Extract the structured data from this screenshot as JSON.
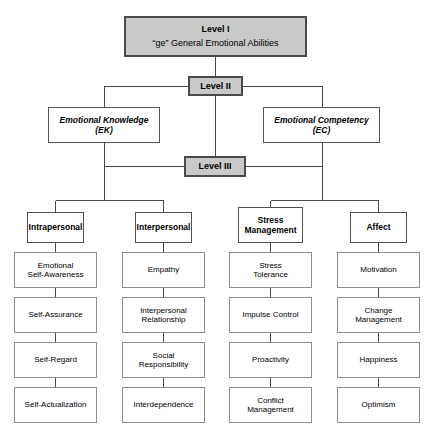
{
  "diagram": {
    "title_level_1": "Level I",
    "subtitle_level_1": "“ge” General Emotional Abilities",
    "level_2": "Level II",
    "level_3": "Level III",
    "branches": [
      {
        "name_line1": "Emotional Knowledge",
        "name_line2": "(EK)"
      },
      {
        "name_line1": "Emotional Competency",
        "name_line2": "(EC)"
      }
    ],
    "columns": [
      {
        "header_line1": "Intrapersonal",
        "header_line2": "",
        "items": [
          {
            "line1": "Emotional",
            "line2": "Self-Awareness"
          },
          {
            "line1": "Self-Assurance",
            "line2": ""
          },
          {
            "line1": "Self-Regard",
            "line2": ""
          },
          {
            "line1": "Self-Actualization",
            "line2": ""
          }
        ]
      },
      {
        "header_line1": "Interpersonal",
        "header_line2": "",
        "items": [
          {
            "line1": "Empathy",
            "line2": ""
          },
          {
            "line1": "Interpersonal",
            "line2": "Relationship"
          },
          {
            "line1": "Social",
            "line2": "Responsibility"
          },
          {
            "line1": "Interdependence",
            "line2": ""
          }
        ]
      },
      {
        "header_line1": "Stress",
        "header_line2": "Management",
        "items": [
          {
            "line1": "Stress",
            "line2": "Tolerance"
          },
          {
            "line1": "Impulse Control",
            "line2": ""
          },
          {
            "line1": "Proactivity",
            "line2": ""
          },
          {
            "line1": "Conflict",
            "line2": "Management"
          }
        ]
      },
      {
        "header_line1": "Affect",
        "header_line2": "",
        "items": [
          {
            "line1": "Motivation",
            "line2": ""
          },
          {
            "line1": "Change",
            "line2": "Management"
          },
          {
            "line1": "Happiness",
            "line2": ""
          },
          {
            "line1": "Optimism",
            "line2": ""
          }
        ]
      }
    ],
    "colors": {
      "level_fill": "#c9c9c9",
      "level_border": "#4a4a4a",
      "box_border": "#555555",
      "leaf_border": "#8d8d8d",
      "line": "#4a4a4a",
      "background": "#ffffff",
      "text": "#000000"
    }
  }
}
